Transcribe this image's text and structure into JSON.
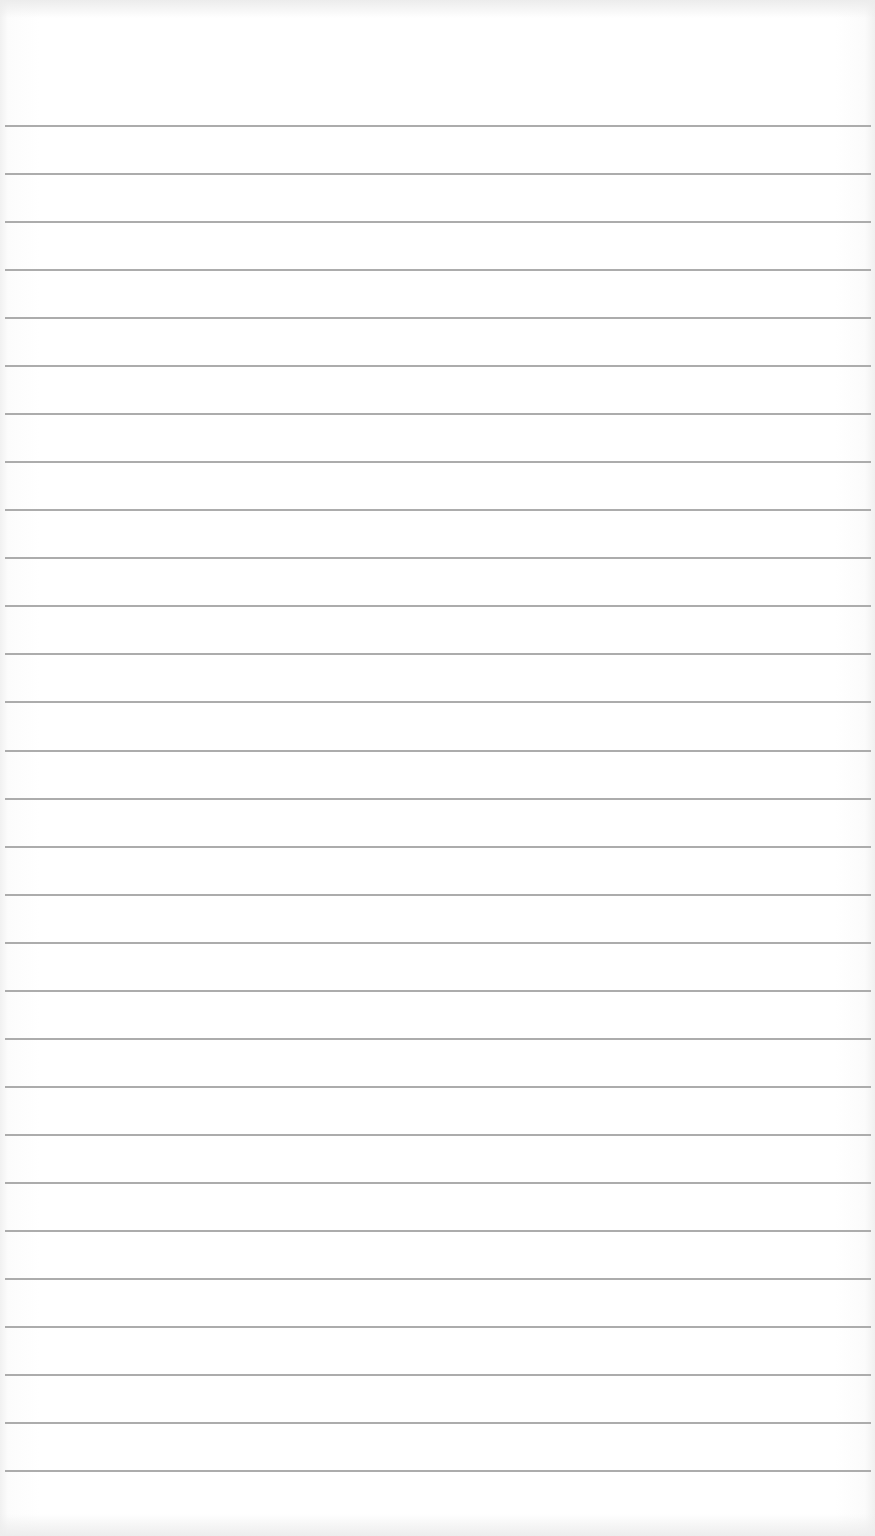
{
  "page": {
    "type": "lined-paper",
    "background_color": "#ffffff",
    "line_color": "#a3a3a3",
    "line_count": 29,
    "first_line_y": 125,
    "line_spacing_px": 48.04,
    "line_thickness_px": 2
  }
}
